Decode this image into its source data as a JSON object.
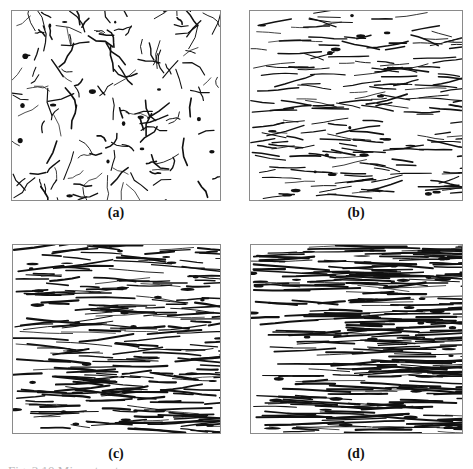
{
  "figure": {
    "panels": [
      {
        "id": "a",
        "label": "(a)",
        "morphology": "equiaxed",
        "elongation": 1.0,
        "density": 0.55,
        "dark_phase": 0.25
      },
      {
        "id": "b",
        "label": "(b)",
        "morphology": "slightly-elongated",
        "elongation": 2.2,
        "density": 0.6,
        "dark_phase": 0.3
      },
      {
        "id": "c",
        "label": "(c)",
        "morphology": "elongated-banded",
        "elongation": 4.0,
        "density": 0.8,
        "dark_phase": 0.4
      },
      {
        "id": "d",
        "label": "(d)",
        "morphology": "fibrous-banded",
        "elongation": 7.0,
        "density": 1.0,
        "dark_phase": 0.55
      }
    ],
    "caption": "Fig. 3.10 Microstructures ..."
  },
  "colors": {
    "ink": "#111111",
    "frame": "#8a8a8a",
    "background": "#ffffff"
  }
}
